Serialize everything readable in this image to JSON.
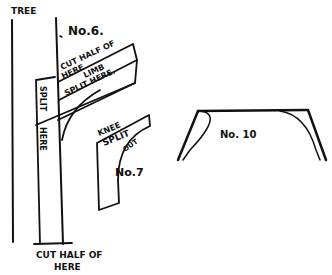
{
  "diagram": {
    "labels": {
      "tree": "TREE",
      "no6": "No.6.",
      "cut_half_of_top_1": "CUT HALF OF",
      "cut_half_of_top_2": "HERE",
      "limb": "LIMB",
      "split_here_limb": "SPLIT HERE.",
      "split_vertical": "SPLIT",
      "here_vertical": "HERE",
      "knee": "KNEE",
      "split_knee": "SPLIT",
      "out": "OUT",
      "no7": "No.7",
      "cut_half_of_bottom_1": "CUT HALF OF",
      "cut_half_of_bottom_2": "HERE",
      "no10": "No. 10"
    },
    "colors": {
      "ink": "#111111",
      "paper": "#ffffff"
    }
  }
}
